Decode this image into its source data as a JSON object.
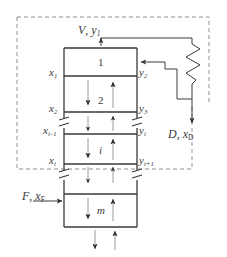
{
  "diagram": {
    "colors": {
      "line": "#3a3a3a",
      "dashed_boundary": "#8a8a8a",
      "background": "#ffffff",
      "arrow": "#2b2b2b"
    },
    "streams": {
      "overhead_vapor": {
        "label_main": "V",
        "label_sub": "y",
        "label_subscript": "1",
        "text": "V, y1"
      },
      "distillate": {
        "label_main": "D",
        "label_sub": "x",
        "label_subscript": "D",
        "text": "D, xD"
      },
      "feed": {
        "label_main": "F",
        "label_sub": "x",
        "label_subscript": "F",
        "text": "F, xF"
      }
    },
    "liquid_compositions": [
      {
        "symbol": "x",
        "subscript": "1"
      },
      {
        "symbol": "x",
        "subscript": "2"
      },
      {
        "symbol": "x",
        "subscript": "i–1"
      },
      {
        "symbol": "x",
        "subscript": "i"
      }
    ],
    "vapor_compositions": [
      {
        "symbol": "y",
        "subscript": "2"
      },
      {
        "symbol": "y",
        "subscript": "3"
      },
      {
        "symbol": "y",
        "subscript": "i"
      },
      {
        "symbol": "y",
        "subscript": "i+1"
      }
    ],
    "stages": [
      {
        "label": "1"
      },
      {
        "label": "2"
      },
      {
        "label": "i"
      },
      {
        "label": "m"
      }
    ],
    "elements": {
      "condenser": "condenser-zigzag",
      "envelope": "dashed-control-volume",
      "column": "column-body"
    }
  }
}
